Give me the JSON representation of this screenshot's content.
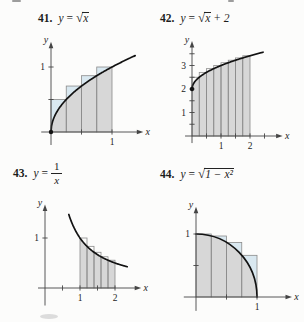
{
  "colors": {
    "shade": "#d7d7d7",
    "sliver": "#d9e8f0",
    "curve": "#121212",
    "axis": "#454545",
    "rect_outline": "#8b8b8b",
    "text": "#1c1c1c",
    "background": "#fcfcfb"
  },
  "panels": [
    {
      "number": "41.",
      "formula": {
        "var": "y",
        "eq": "=",
        "radical_sign": "√",
        "radicand": "x",
        "suffix": ""
      },
      "plot": {
        "fn": "sqrt",
        "w": 126,
        "h": 118,
        "ox": 25,
        "oy": 98,
        "sx": 61,
        "sy": 65,
        "x_axis": {
          "from": -0.16,
          "to": 1.44,
          "label": "x"
        },
        "y_axis": {
          "from": -0.2,
          "to": 1.32,
          "label": "y"
        },
        "x_ticks": [
          {
            "v": 0.5
          },
          {
            "v": 1,
            "label": "1"
          }
        ],
        "y_ticks": [
          {
            "v": 0.5
          },
          {
            "v": 1,
            "label": "1"
          }
        ],
        "curve": [
          0,
          1.38
        ],
        "shade": [
          0,
          1
        ],
        "rects": [
          [
            0,
            0.25,
            0.5
          ],
          [
            0.25,
            0.5,
            0.70711
          ],
          [
            0.5,
            0.75,
            0.86603
          ],
          [
            0.75,
            1,
            1
          ]
        ],
        "sliver": "#d9e8f0",
        "dot": [
          0,
          0
        ]
      }
    },
    {
      "number": "42.",
      "formula": {
        "var": "y",
        "eq": "=",
        "radical_sign": "√",
        "radicand": "x",
        "suffix": " + 2"
      },
      "plot": {
        "fn": "sqrt2",
        "w": 126,
        "h": 122,
        "ox": 20,
        "oy": 106,
        "sx": 29,
        "sy": 23.5,
        "x_axis": {
          "from": -0.24,
          "to": 2.97,
          "label": "x"
        },
        "y_axis": {
          "from": -0.3,
          "to": 3.85,
          "label": "y"
        },
        "x_ticks": [
          {
            "v": 0.5
          },
          {
            "v": 1,
            "label": "1"
          },
          {
            "v": 1.5
          },
          {
            "v": 2,
            "label": "2"
          },
          {
            "v": 2.5
          }
        ],
        "y_ticks": [
          {
            "v": 0.5
          },
          {
            "v": 1,
            "label": "1"
          },
          {
            "v": 1.5
          },
          {
            "v": 2,
            "label": "2"
          },
          {
            "v": 2.5
          },
          {
            "v": 3,
            "label": "3"
          },
          {
            "v": 3.5
          }
        ],
        "curve": [
          0,
          2.45
        ],
        "shade": [
          0,
          2
        ],
        "rects": [
          [
            0,
            0.25,
            2.5
          ],
          [
            0.25,
            0.5,
            2.70711
          ],
          [
            0.5,
            0.75,
            2.86603
          ],
          [
            0.75,
            1,
            3
          ],
          [
            1,
            1.25,
            3.11803
          ],
          [
            1.25,
            1.5,
            3.22474
          ],
          [
            1.5,
            1.75,
            3.32288
          ],
          [
            1.75,
            2,
            3.41421
          ]
        ],
        "sliver": null,
        "dot": [
          0,
          2
        ]
      }
    },
    {
      "number": "43.",
      "formula": {
        "var": "y",
        "eq": "=",
        "frac": {
          "num": "1",
          "den": "x"
        }
      },
      "plot": {
        "fn": "inv",
        "w": 136,
        "h": 116,
        "ox": 21,
        "oy": 92,
        "sx": 35,
        "sy": 50,
        "x_axis": {
          "from": -0.2,
          "to": 2.62,
          "label": "x"
        },
        "y_axis": {
          "from": -0.35,
          "to": 1.58,
          "label": "y"
        },
        "x_ticks": [
          {
            "v": 0.5
          },
          {
            "v": 1,
            "label": "1"
          },
          {
            "v": 1.5
          },
          {
            "v": 2,
            "label": "2"
          }
        ],
        "y_ticks": [
          {
            "v": 1,
            "label": "1"
          }
        ],
        "curve": [
          0.68,
          2.35
        ],
        "shade": [
          1,
          2
        ],
        "rects": [
          [
            1,
            1.2,
            1
          ],
          [
            1.2,
            1.4,
            0.83333
          ],
          [
            1.4,
            1.6,
            0.71429
          ],
          [
            1.6,
            1.8,
            0.625
          ],
          [
            1.8,
            2,
            0.55556
          ]
        ],
        "sliver": null,
        "dot": null
      }
    },
    {
      "number": "44.",
      "formula": {
        "var": "y",
        "eq": "=",
        "radical_sign": "√",
        "radicand": "1 − x²",
        "suffix": ""
      },
      "plot": {
        "fn": "circ",
        "w": 126,
        "h": 118,
        "ox": 18,
        "oy": 99,
        "sx": 61,
        "sy": 63,
        "x_axis": {
          "from": -0.2,
          "to": 1.5,
          "label": "x"
        },
        "y_axis": {
          "from": -0.22,
          "to": 1.36,
          "label": "y"
        },
        "x_ticks": [
          {
            "v": 0.5
          },
          {
            "v": 1,
            "label": "1"
          }
        ],
        "y_ticks": [
          {
            "v": 0.5
          },
          {
            "v": 1,
            "label": "1"
          }
        ],
        "curve": [
          0,
          1
        ],
        "shade": [
          0,
          1
        ],
        "rects": [
          [
            0,
            0.25,
            1
          ],
          [
            0.25,
            0.5,
            0.96825
          ],
          [
            0.5,
            0.75,
            0.86603
          ],
          [
            0.75,
            1,
            0.66144
          ]
        ],
        "sliver": "#d9e8f0",
        "dot": null
      }
    }
  ],
  "chart_data": [
    {
      "type": "line",
      "title": "y = √x",
      "interval": [
        0,
        1
      ],
      "n_rectangles": 4,
      "rectangle_rule": "right-endpoint upper sum",
      "rectangle_heights": [
        0.5,
        0.70711,
        0.86603,
        1
      ],
      "xlabel": "x",
      "ylabel": "y",
      "x_tick_labels": [
        "1"
      ],
      "y_tick_labels": [
        "1"
      ],
      "xlim": [
        -0.16,
        1.44
      ],
      "ylim": [
        -0.2,
        1.32
      ],
      "grid": false
    },
    {
      "type": "line",
      "title": "y = √x + 2",
      "interval": [
        0,
        2
      ],
      "n_rectangles": 8,
      "rectangle_rule": "right-endpoint upper sum",
      "rectangle_heights": [
        2.5,
        2.70711,
        2.86603,
        3,
        3.11803,
        3.22474,
        3.32288,
        3.41421
      ],
      "xlabel": "x",
      "ylabel": "y",
      "x_tick_labels": [
        "1",
        "2"
      ],
      "y_tick_labels": [
        "1",
        "2",
        "3"
      ],
      "xlim": [
        -0.24,
        2.97
      ],
      "ylim": [
        -0.3,
        3.85
      ],
      "grid": false
    },
    {
      "type": "line",
      "title": "y = 1/x",
      "interval": [
        1,
        2
      ],
      "n_rectangles": 5,
      "rectangle_rule": "left-endpoint upper sum",
      "rectangle_heights": [
        1,
        0.83333,
        0.71429,
        0.625,
        0.55556
      ],
      "xlabel": "x",
      "ylabel": "y",
      "x_tick_labels": [
        "1",
        "2"
      ],
      "y_tick_labels": [
        "1"
      ],
      "xlim": [
        -0.2,
        2.62
      ],
      "ylim": [
        -0.35,
        1.58
      ],
      "grid": false
    },
    {
      "type": "line",
      "title": "y = √(1 − x²)",
      "interval": [
        0,
        1
      ],
      "n_rectangles": 4,
      "rectangle_rule": "left-endpoint upper sum",
      "rectangle_heights": [
        1,
        0.96825,
        0.86603,
        0.66144
      ],
      "xlabel": "x",
      "ylabel": "y",
      "x_tick_labels": [
        "1"
      ],
      "y_tick_labels": [
        "1"
      ],
      "xlim": [
        -0.2,
        1.5
      ],
      "ylim": [
        -0.22,
        1.36
      ],
      "grid": false
    }
  ]
}
